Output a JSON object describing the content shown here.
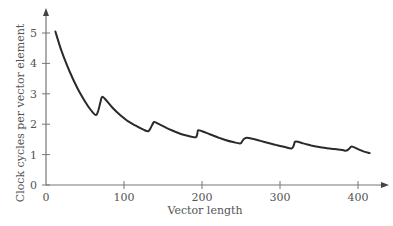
{
  "chart_data": {
    "type": "line",
    "title": "",
    "xlabel": "Vector length",
    "ylabel": "Clock cycles per vector element",
    "xlim": [
      0,
      430
    ],
    "ylim": [
      0,
      5.5
    ],
    "x_ticks": [
      0,
      100,
      200,
      300,
      400
    ],
    "y_ticks": [
      0,
      1,
      2,
      3,
      4,
      5
    ],
    "grid": false,
    "legend": null,
    "series": [
      {
        "name": "cycles per element",
        "x": [
          12,
          20,
          30,
          40,
          50,
          58,
          64,
          67,
          70,
          72,
          76,
          85,
          95,
          105,
          115,
          125,
          131,
          134,
          137,
          139,
          145,
          155,
          165,
          175,
          185,
          192,
          194,
          195,
          200,
          210,
          220,
          230,
          240,
          249,
          252,
          256,
          265,
          275,
          285,
          295,
          305,
          315,
          318,
          320,
          330,
          340,
          350,
          360,
          370,
          380,
          385,
          389,
          392,
          400,
          408,
          415
        ],
        "values": [
          5.05,
          4.4,
          3.75,
          3.2,
          2.75,
          2.45,
          2.3,
          2.45,
          2.75,
          2.9,
          2.82,
          2.55,
          2.3,
          2.1,
          1.95,
          1.82,
          1.77,
          1.87,
          2.02,
          2.07,
          2.0,
          1.87,
          1.76,
          1.66,
          1.6,
          1.57,
          1.68,
          1.8,
          1.77,
          1.67,
          1.57,
          1.48,
          1.41,
          1.37,
          1.46,
          1.55,
          1.52,
          1.45,
          1.38,
          1.32,
          1.26,
          1.2,
          1.33,
          1.43,
          1.37,
          1.3,
          1.25,
          1.21,
          1.18,
          1.15,
          1.13,
          1.2,
          1.27,
          1.18,
          1.1,
          1.05
        ]
      }
    ]
  }
}
